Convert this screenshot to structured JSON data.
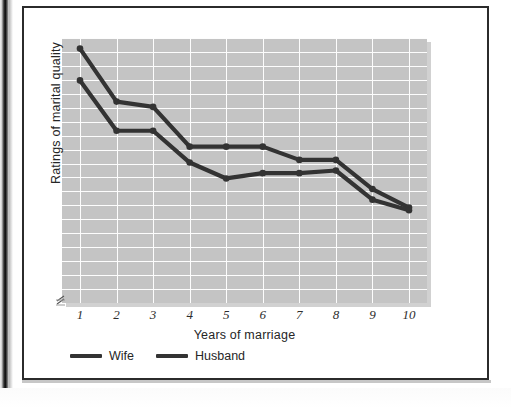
{
  "figure": {
    "background_color": "#ffffff",
    "frame_color": "#2b2b2b",
    "plot_background_color": "#c4c4c4",
    "gridline_color": "#fdfdfd",
    "series_color": "#333333",
    "axis_break_marker": "axis-break-zigzag"
  },
  "chart_data": {
    "type": "line",
    "title": "",
    "xlabel": "Years of marriage",
    "ylabel": "Ratings of marital quality",
    "x": [
      1,
      2,
      3,
      4,
      5,
      6,
      7,
      8,
      9,
      10
    ],
    "categories": [
      "1",
      "2",
      "3",
      "4",
      "5",
      "6",
      "7",
      "8",
      "9",
      "10"
    ],
    "xtick_labels": [
      "1",
      "2",
      "3",
      "4",
      "5",
      "6",
      "7",
      "8",
      "9",
      "10"
    ],
    "ytick_labels": [],
    "xlim": [
      1,
      10
    ],
    "ylim": [
      0,
      100
    ],
    "grid": true,
    "grid_horizontal_lines": 19,
    "grid_vertical_lines": 10,
    "legend_position": "below-axis-left",
    "y_axis_broken": true,
    "series": [
      {
        "name": "Wife",
        "color": "#333333",
        "values": [
          96,
          76,
          74,
          59,
          59,
          59,
          54,
          54,
          43,
          36
        ]
      },
      {
        "name": "Husband",
        "color": "#333333",
        "values": [
          84,
          65,
          65,
          53,
          47,
          49,
          49,
          50,
          39,
          35
        ]
      }
    ],
    "legend": [
      "Wife",
      "Husband"
    ]
  }
}
